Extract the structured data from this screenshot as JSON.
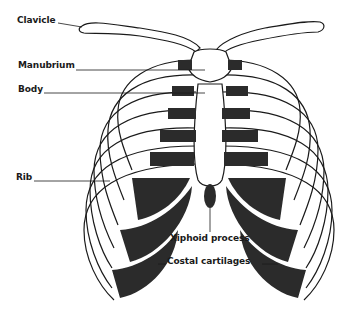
{
  "diagram": {
    "labels": [
      {
        "id": "clavicle",
        "text": "Clavicle",
        "x": 17,
        "y": 15
      },
      {
        "id": "manubrium",
        "text": "Manubrium",
        "x": 18,
        "y": 60
      },
      {
        "id": "body",
        "text": "Body",
        "x": 18,
        "y": 84
      },
      {
        "id": "rib",
        "text": "Rib",
        "x": 16,
        "y": 175
      },
      {
        "id": "xiphoid",
        "text": "Xiphoid process",
        "x": 170,
        "y": 233
      },
      {
        "id": "costal",
        "text": "Costal cartilages",
        "x": 167,
        "y": 256
      }
    ],
    "colors": {
      "bone": "#ffffff",
      "outline": "#1a1a1a",
      "cartilage": "#2b2b2b"
    }
  }
}
